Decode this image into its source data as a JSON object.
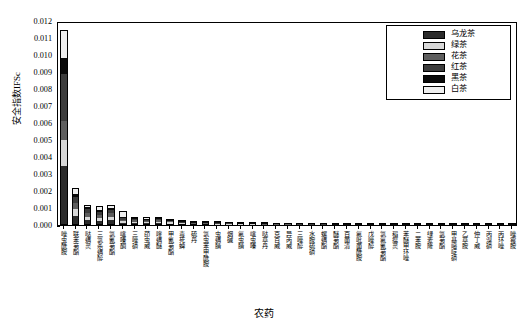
{
  "chart_data": {
    "type": "bar",
    "stacked": true,
    "title": "",
    "xlabel": "农药",
    "ylabel": "安全指数IFSc",
    "ylim": [
      0,
      0.012
    ],
    "ytick_labels": [
      "0.000",
      "0.001",
      "0.002",
      "0.003",
      "0.004",
      "0.005",
      "0.006",
      "0.007",
      "0.008",
      "0.009",
      "0.010",
      "0.011",
      "0.012"
    ],
    "ytick_values": [
      0,
      0.001,
      0.002,
      0.003,
      0.004,
      0.005,
      0.006,
      0.007,
      0.008,
      0.009,
      0.01,
      0.011,
      0.012
    ],
    "grid": false,
    "legend_position": "top-right",
    "legend": [
      "乌龙茶",
      "绿茶",
      "花茶",
      "红茶",
      "黑茶",
      "白茶"
    ],
    "series_colors": [
      "#2b2b2b",
      "#d8d8d8",
      "#5e5e5e",
      "#3c3c3c",
      "#0a0a0a",
      "#efefef"
    ],
    "categories": [
      "唑虫酰胺",
      "联苯菊酯",
      "哒螨灵",
      "三氯杀螨醇",
      "氯氰菊酯",
      "噻嗪酮",
      "三唑磷",
      "茚虫威",
      "喹螨醚",
      "甲氰菊酯",
      "毒死蜱",
      "硫丹",
      "氯虫苯甲酰胺",
      "虫螨腈",
      "烟碱",
      "氟虫腈",
      "噻虫嗪",
      "哒草丹",
      "克百威",
      "异丙威",
      "三唑醇",
      "水胺硫磷",
      "螺螨酯",
      "醚菊酯",
      "百菌清",
      "氟吡菌酰胺",
      "戊唑醇",
      "氯氟氰菊酯",
      "稻瘟灵",
      "苯醚甲环唑",
      "二苯胺",
      "绿麦隆",
      "氯菊酯",
      "甲基嘧啶磷",
      "乙草胺",
      "仲丁威",
      "丙溴磷",
      "丙环唑",
      "唑霉胺"
    ],
    "series": [
      {
        "name": "乌龙茶",
        "values": [
          0.00345,
          0.00055,
          0.00028,
          0.00024,
          0.00028,
          0.00012,
          0.00011,
          9e-05,
          0.00011,
          8e-05,
          6e-05,
          5e-05,
          5e-05,
          4e-05,
          4e-05,
          3e-05,
          3e-05,
          2e-05,
          2e-05,
          2e-05,
          2e-05,
          2e-05,
          2e-05,
          1e-05,
          1e-05,
          1e-05,
          1e-05,
          1e-05,
          1e-05,
          1e-05,
          1e-05,
          1e-05,
          1e-05,
          1e-05,
          1e-05,
          1e-05,
          1e-05,
          1e-05,
          1e-05
        ]
      },
      {
        "name": "绿茶",
        "values": [
          0.00155,
          0.00042,
          0.00022,
          0.0002,
          0.00022,
          0.0001,
          9e-05,
          8e-05,
          9e-05,
          7e-05,
          5e-05,
          4e-05,
          4e-05,
          3e-05,
          3e-05,
          2e-05,
          2e-05,
          2e-05,
          2e-05,
          2e-05,
          1e-05,
          1e-05,
          1e-05,
          1e-05,
          1e-05,
          1e-05,
          1e-05,
          1e-05,
          1e-05,
          1e-05,
          1e-05,
          1e-05,
          1e-05,
          1e-05,
          1e-05,
          1e-05,
          1e-05,
          1e-05,
          1e-05
        ]
      },
      {
        "name": "花茶",
        "values": [
          0.0011,
          0.0003,
          0.0002,
          0.00016,
          0.00018,
          9e-05,
          8e-05,
          6e-05,
          7e-05,
          6e-05,
          4e-05,
          3e-05,
          3e-05,
          3e-05,
          2e-05,
          2e-05,
          2e-05,
          2e-05,
          1e-05,
          1e-05,
          1e-05,
          1e-05,
          1e-05,
          1e-05,
          1e-05,
          1e-05,
          1e-05,
          1e-05,
          1e-05,
          1e-05,
          1e-05,
          1e-05,
          1e-05,
          1e-05,
          1e-05,
          1e-05,
          1e-05,
          1e-05,
          1e-05
        ]
      },
      {
        "name": "红茶",
        "values": [
          0.0028,
          0.00035,
          0.00022,
          0.00018,
          0.0002,
          0.0001,
          8e-05,
          7e-05,
          8e-05,
          6e-05,
          5e-05,
          4e-05,
          3e-05,
          3e-05,
          2e-05,
          2e-05,
          2e-05,
          2e-05,
          2e-05,
          1e-05,
          1e-05,
          1e-05,
          1e-05,
          1e-05,
          1e-05,
          1e-05,
          1e-05,
          1e-05,
          1e-05,
          1e-05,
          1e-05,
          1e-05,
          1e-05,
          1e-05,
          1e-05,
          1e-05,
          1e-05,
          1e-05,
          1e-05
        ]
      },
      {
        "name": "黑茶",
        "values": [
          0.0009,
          0.0002,
          0.00012,
          0.0001,
          0.00011,
          6e-05,
          5e-05,
          4e-05,
          5e-05,
          4e-05,
          3e-05,
          2e-05,
          2e-05,
          2e-05,
          2e-05,
          1e-05,
          1e-05,
          1e-05,
          1e-05,
          1e-05,
          1e-05,
          1e-05,
          1e-05,
          1e-05,
          1e-05,
          1e-05,
          1e-05,
          1e-05,
          1e-05,
          1e-05,
          1e-05,
          1e-05,
          1e-05,
          1e-05,
          1e-05,
          1e-05,
          1e-05,
          1e-05,
          1e-05
        ]
      },
      {
        "name": "白茶",
        "values": [
          0.0017,
          0.00033,
          0.00016,
          0.00022,
          0.00016,
          0.00038,
          9e-05,
          0.00016,
          5e-05,
          5e-05,
          4e-05,
          3e-05,
          3e-05,
          2e-05,
          2e-05,
          2e-05,
          2e-05,
          1e-05,
          1e-05,
          1e-05,
          1e-05,
          1e-05,
          1e-05,
          1e-05,
          1e-05,
          1e-05,
          1e-05,
          1e-05,
          1e-05,
          1e-05,
          1e-05,
          1e-05,
          1e-05,
          1e-05,
          1e-05,
          1e-05,
          1e-05,
          1e-05,
          1e-05
        ]
      }
    ]
  }
}
